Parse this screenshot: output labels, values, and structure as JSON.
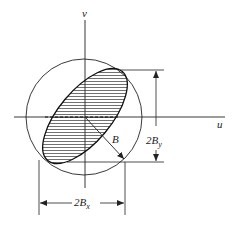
{
  "diagram": {
    "axes": {
      "horizontal_label": "u",
      "vertical_label": "v"
    },
    "labels": {
      "radius": "B",
      "height_prefix": "2",
      "height_symbol": "B",
      "height_subscript": "y",
      "width_prefix": "2",
      "width_symbol": "B",
      "width_subscript": "x"
    },
    "colors": {
      "stroke": "#222222",
      "background": "#ffffff"
    }
  }
}
